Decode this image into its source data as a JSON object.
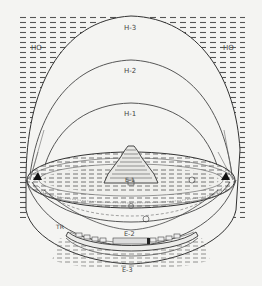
{
  "diagram": {
    "colors": {
      "background": "#f4f4f2",
      "ink": "#3a3a3a",
      "hatch": "#555555",
      "fill_light": "#efefec"
    },
    "labels": {
      "h3": "H-3",
      "h2": "H-2",
      "h1": "H-1",
      "ho_left": "HO",
      "ho_right": "HO",
      "e1": "E-1",
      "e2": "E-2",
      "e3": "E-3",
      "tr": "TR"
    }
  }
}
